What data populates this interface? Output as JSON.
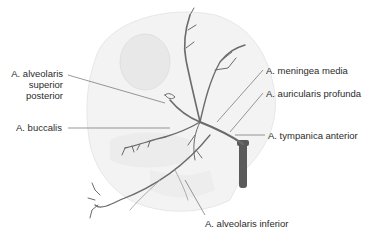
{
  "diagram": {
    "labels": {
      "alveolaris_superior_posterior": [
        "A. alveolaris",
        "superior",
        "posterior"
      ],
      "buccalis": "A. buccalis",
      "meningea_media": "A. meningea media",
      "auricularis_profunda": "A. auricularis profunda",
      "tympanica_anterior": "A. tympanica anterior",
      "alveolaris_inferior": "A. alveolaris inferior"
    },
    "colors": {
      "artery": "#6b6b6b",
      "trunk": "#5a5a5a",
      "skull_shading": "#ececec",
      "leader_line": "#555555",
      "text": "#2b2b2b"
    }
  }
}
